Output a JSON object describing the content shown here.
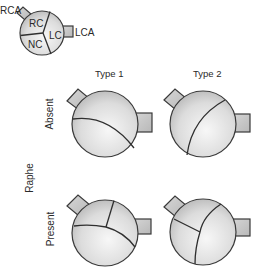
{
  "key_diagram": {
    "coronary_labels": {
      "right": "RCA",
      "left": "LCA"
    },
    "cusp_labels": {
      "right": "RC",
      "left": "LC",
      "non": "NC"
    }
  },
  "columns": [
    {
      "label": "Type 1"
    },
    {
      "label": "Type 2"
    }
  ],
  "row_axis_label": "Raphe",
  "rows": [
    {
      "label": "Absent"
    },
    {
      "label": "Present"
    }
  ],
  "colors": {
    "valve_fill_light": "#f2f2f2",
    "valve_fill_dark": "#bdbdbd",
    "stub_fill": "#c8c8c8",
    "outline": "#3a3a3a",
    "text": "#2a2a2a"
  }
}
